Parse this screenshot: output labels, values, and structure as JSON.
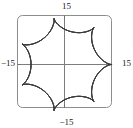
{
  "figure": {
    "kind": "parametric-plot",
    "frame": {
      "style": "rounded-rectangle",
      "stroke_color": "#8a8a8a"
    },
    "axes": {
      "stroke_color": "#7d7d7d",
      "x_label_left": "−15",
      "x_label_right": "15",
      "y_label_top": "15",
      "y_label_bottom": "−15"
    },
    "curve": {
      "stroke_color": "#3a3a3a"
    }
  },
  "chart_data": {
    "type": "line",
    "title": "",
    "xlabel": "",
    "ylabel": "",
    "xlim": [
      -15,
      15
    ],
    "ylim": [
      -15,
      15
    ],
    "xticks": [
      -15,
      15
    ],
    "yticks": [
      -15,
      15
    ],
    "xticklabels": [
      "−15",
      "15"
    ],
    "yticklabels": [
      "−15",
      "15"
    ],
    "grid": false,
    "legend": null,
    "axis_lines_through_origin": true,
    "curve_description": "hypotrochoid-style rose with 10 inner loops and 10 outer scalloped arcs",
    "parametric": {
      "x": "9*cos(t) + 4*cos(9*t/4)",
      "y": "9*sin(t) - 4*sin(9*t/4)",
      "t_range": [
        0,
        25.132741228718345
      ],
      "lobes": 10,
      "outer_radius": 13,
      "inner_loop_radius": 2.2
    },
    "series": [
      {
        "name": "curve",
        "x": [
          13.0,
          12.36,
          10.51,
          7.65,
          4.02,
          0.0,
          -4.02,
          -7.65,
          -10.51,
          -12.36,
          -13.0,
          -12.36,
          -10.51,
          -7.65,
          -4.02,
          0.0,
          4.02,
          7.65,
          10.51,
          12.36,
          13.0
        ],
        "y": [
          0.0,
          4.02,
          7.65,
          10.51,
          12.36,
          13.0,
          12.36,
          10.51,
          7.65,
          4.02,
          0.0,
          -4.02,
          -7.65,
          -10.51,
          -12.36,
          -13.0,
          -12.36,
          -10.51,
          -7.65,
          -4.02,
          0.0
        ]
      }
    ]
  }
}
